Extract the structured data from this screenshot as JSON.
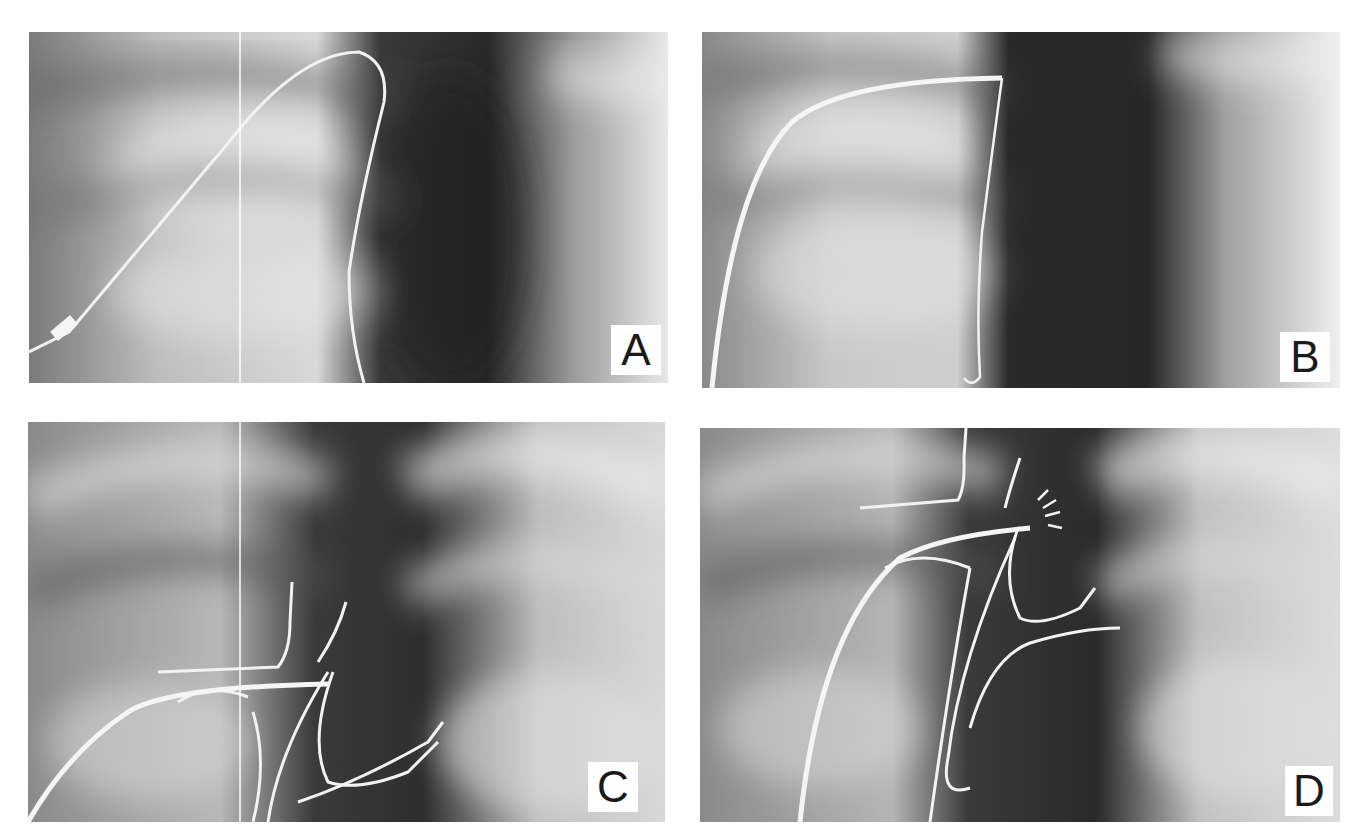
{
  "figure": {
    "panels": [
      {
        "id": "A",
        "label": "A"
      },
      {
        "id": "B",
        "label": "B"
      },
      {
        "id": "C",
        "label": "C"
      },
      {
        "id": "D",
        "label": "D"
      }
    ]
  },
  "colors": {
    "background": "#ffffff",
    "wire": "#f2f2f2",
    "label_bg": "#ffffff",
    "label_text": "#1a1a1a"
  }
}
